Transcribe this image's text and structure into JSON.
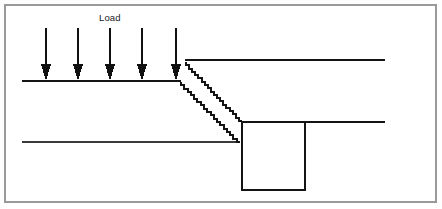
{
  "figure": {
    "width": 442,
    "height": 209,
    "background_color": "#ffffff",
    "line_color": "#1a1a1a",
    "border_color": "#9a9a9a"
  },
  "labels": {
    "load": "Load"
  },
  "annotations": {
    "load_label": {
      "text": "Load",
      "x": 99,
      "y": 13
    }
  },
  "border": {
    "name": "figure-border",
    "x": 5,
    "y": 5,
    "width": 431,
    "height": 197,
    "stroke": "#9a9a9a",
    "stroke_width": 1.4
  },
  "arrows": {
    "count": 5,
    "label": "Load",
    "color": "#111111",
    "shaft_top_y": 28,
    "tip_y": 81,
    "head_height": 17,
    "head_half_width": 5,
    "shaft_width": 1.4,
    "x_positions": [
      46,
      78,
      110,
      142,
      176
    ]
  },
  "lines": [
    {
      "name": "top-ground-line",
      "x1": 22,
      "y1": 81,
      "x2": 181,
      "y2": 81,
      "stroke": "#141414",
      "stroke_width": 2.0
    },
    {
      "name": "upper-right-ground-line",
      "x1": 185,
      "y1": 60,
      "x2": 385,
      "y2": 60,
      "stroke": "#141414",
      "stroke_width": 1.9
    },
    {
      "name": "mid-right-ground-line",
      "x1": 242,
      "y1": 122,
      "x2": 385,
      "y2": 122,
      "stroke": "#141414",
      "stroke_width": 1.9
    },
    {
      "name": "lower-left-ground-line",
      "x1": 22,
      "y1": 142,
      "x2": 240,
      "y2": 142,
      "stroke": "#3a3a3a",
      "stroke_width": 1.2
    }
  ],
  "stepped_lines": [
    {
      "name": "upper-load-spread-line",
      "x1": 186,
      "y1": 62,
      "x2": 242,
      "y2": 121,
      "steps": 18,
      "stroke": "#141414",
      "stroke_width": 2.0
    },
    {
      "name": "lower-load-spread-line",
      "x1": 181,
      "y1": 82,
      "x2": 240,
      "y2": 142,
      "steps": 18,
      "stroke": "#141414",
      "stroke_width": 2.0
    }
  ],
  "rectangle": {
    "name": "foundation-trench",
    "x": 242,
    "y": 122,
    "width": 63,
    "height": 68,
    "stroke": "#141414",
    "stroke_width": 1.9,
    "fill": "none"
  }
}
